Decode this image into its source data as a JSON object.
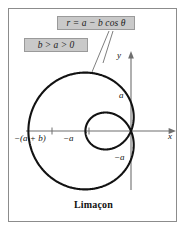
{
  "figure": {
    "caption": "Limaçon",
    "equation": "r = a − b cos θ",
    "condition": "b > a > 0",
    "axis_labels": {
      "x": "x",
      "y": "y"
    },
    "tick_labels": {
      "y_positive": "a",
      "y_negative": "−a",
      "x_inner": "−a",
      "x_outer": "−(a + b)"
    },
    "colors": {
      "curve": "#121212",
      "axis": "#6f6f6f",
      "callout_fill": "#c9c9c9",
      "callout_border": "#9a9a9a",
      "frame": "#8c8c8c",
      "background": "#ffffff"
    }
  },
  "chart_data": {
    "type": "line",
    "title": "Limaçon",
    "curve_name": "limaçon with inner loop",
    "equation": "r = a − b cos θ",
    "condition": "b > a > 0",
    "parameters": {
      "a": 1,
      "b": 2.6
    },
    "polar": true,
    "theta_range_deg": [
      0,
      360
    ],
    "xlabel": "x",
    "ylabel": "y",
    "xlim": [
      -3.9,
      1.1
    ],
    "ylim": [
      -2.6,
      2.6
    ],
    "grid": false,
    "legend": false,
    "x_ticks": [
      -3.6,
      -1.0
    ],
    "x_tick_labels": [
      "−(a + b)",
      "−a"
    ],
    "y_ticks": [
      1.0,
      -1.0
    ],
    "y_tick_labels": [
      "a",
      "−a"
    ],
    "features": {
      "outer_loop_extent_x": -3.6,
      "inner_loop_extent_x": 1.6,
      "y_intercepts": [
        1.0,
        -1.0
      ],
      "origin_crossings_theta_deg": [
        67.4,
        292.6
      ]
    },
    "annotations": [
      {
        "text": "r = a − b cos θ",
        "type": "callout",
        "points_to": "curve"
      },
      {
        "text": "b > a > 0",
        "type": "callout"
      }
    ]
  }
}
